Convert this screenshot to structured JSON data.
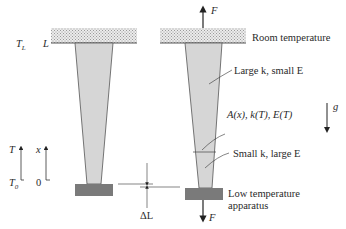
{
  "diagram": {
    "type": "tapered-rod-thermal-stress",
    "colors": {
      "rod_fill": "#d6d6d6",
      "rod_stroke": "#555555",
      "plate_fill": "#e6e6e6",
      "block_fill": "#7a7a7a",
      "line": "#333333"
    },
    "left_figure": {
      "labels": {
        "temperature_top": "T",
        "temperature_top_sub": "L",
        "position_top": "L",
        "temperature_axis": "T",
        "position_axis": "x",
        "temperature_bottom": "T",
        "temperature_bottom_sub": "0",
        "position_bottom": "0",
        "elongation": "ΔL"
      }
    },
    "right_figure": {
      "labels": {
        "force_top": "F",
        "force_bottom": "F",
        "room_temperature": "Room temperature",
        "upper_region": "Large k, small E",
        "cross_section": "A(x), k(T), E(T)",
        "lower_region": "Small k, large E",
        "low_temp_line1": "Low temperature",
        "low_temp_line2": "apparatus",
        "gravity": "g"
      }
    }
  }
}
